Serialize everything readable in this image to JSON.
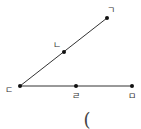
{
  "diagram": {
    "type": "geometry-rays",
    "points": [
      {
        "id": "giyeok",
        "label": "ㄱ",
        "x": 107,
        "y": 18,
        "lx": 111,
        "ly": 10
      },
      {
        "id": "nieun",
        "label": "ㄴ",
        "x": 64,
        "y": 52,
        "lx": 57,
        "ly": 45
      },
      {
        "id": "digeut",
        "label": "ㄷ",
        "x": 20,
        "y": 86,
        "lx": 9,
        "ly": 90
      },
      {
        "id": "rieul",
        "label": "ㄹ",
        "x": 76,
        "y": 86,
        "lx": 76,
        "ly": 96
      },
      {
        "id": "mieum",
        "label": "ㅁ",
        "x": 132,
        "y": 86,
        "lx": 132,
        "ly": 96
      }
    ],
    "segments": [
      {
        "from": "digeut",
        "to": "giyeok"
      },
      {
        "from": "digeut",
        "to": "mieum"
      }
    ],
    "line_color": "#333333",
    "point_color": "#111111"
  },
  "answer_blank": {
    "text": "(",
    "x": 87,
    "y": 120
  }
}
